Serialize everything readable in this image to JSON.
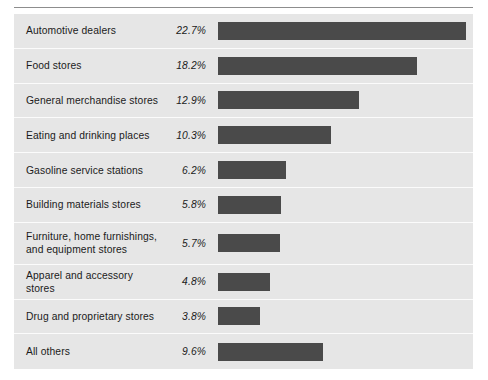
{
  "chart_data": {
    "type": "bar",
    "title": "",
    "subtitle": "",
    "xlabel": "",
    "ylabel": "",
    "orientation": "horizontal",
    "grid": false,
    "legend": false,
    "value_suffix": "%",
    "xlim": [
      0,
      22.7
    ],
    "categories": [
      "Automotive dealers",
      "Food stores",
      "General merchandise stores",
      "Eating and drinking places",
      "Gasoline service stations",
      "Building materials stores",
      "Furniture, home furnishings, and equipment stores",
      "Apparel and accessory stores",
      "Drug and proprietary stores",
      "All others"
    ],
    "values": [
      22.7,
      18.2,
      12.9,
      10.3,
      6.2,
      5.8,
      5.7,
      4.8,
      3.8,
      9.6
    ],
    "value_labels": [
      "22.7%",
      "18.2%",
      "12.9%",
      "10.3%",
      "6.2%",
      "5.8%",
      "5.7%",
      "4.8%",
      "3.8%",
      "9.6%"
    ],
    "bar_color": "#4a4a4a",
    "panel_color": "#e6e6e6",
    "separator_color": "#fbfbfb",
    "rule_color": "#8d8d8d"
  },
  "rows": [
    {
      "label": "Automotive dealers",
      "pct": "22.7%",
      "value": 22.7,
      "tall": false
    },
    {
      "label": "Food stores",
      "pct": "18.2%",
      "value": 18.2,
      "tall": false
    },
    {
      "label": "General merchandise stores",
      "pct": "12.9%",
      "value": 12.9,
      "tall": false
    },
    {
      "label": "Eating and drinking places",
      "pct": "10.3%",
      "value": 10.3,
      "tall": false
    },
    {
      "label": "Gasoline service stations",
      "pct": "6.2%",
      "value": 6.2,
      "tall": false
    },
    {
      "label": "Building materials stores",
      "pct": "5.8%",
      "value": 5.8,
      "tall": false
    },
    {
      "label": "Furniture, home furnishings, and equipment stores",
      "pct": "5.7%",
      "value": 5.7,
      "tall": true
    },
    {
      "label": "Apparel and accessory stores",
      "pct": "4.8%",
      "value": 4.8,
      "tall": false
    },
    {
      "label": "Drug and proprietary stores",
      "pct": "3.8%",
      "value": 3.8,
      "tall": false
    },
    {
      "label": "All others",
      "pct": "9.6%",
      "value": 9.6,
      "tall": false
    }
  ],
  "scale": {
    "px_per_unit": 10.925,
    "max_value": 22.7
  }
}
